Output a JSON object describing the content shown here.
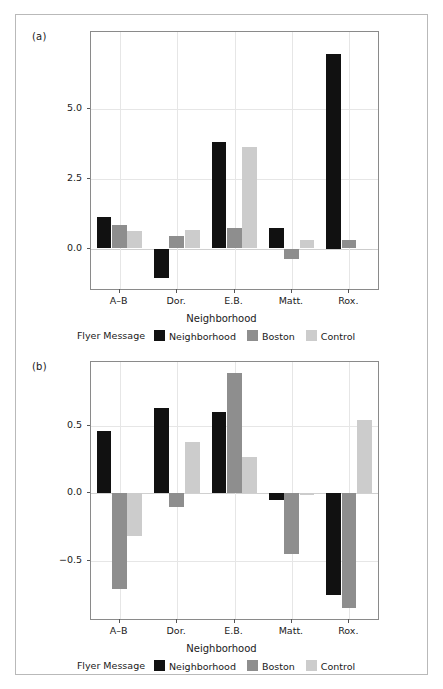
{
  "figure": {
    "panels": [
      {
        "tag": "(a)"
      },
      {
        "tag": "(b)"
      }
    ],
    "legend": {
      "title": "Flyer Message",
      "entries": [
        {
          "label": "Neighborhood",
          "color": "#111111"
        },
        {
          "label": "Boston",
          "color": "#8e8e8e"
        },
        {
          "label": "Control",
          "color": "#cccccc"
        }
      ]
    },
    "xlabel": "Neighborhood"
  },
  "chart_data": [
    {
      "panel": "(a)",
      "type": "bar",
      "title": "",
      "xlabel": "Neighborhood",
      "ylabel": "",
      "categories": [
        "A–B",
        "Dor.",
        "E.B.",
        "Matt.",
        "Rox."
      ],
      "yticks": [
        0.0,
        2.5,
        5.0
      ],
      "ytick_labels": [
        "0.0",
        "2.5",
        "5.0"
      ],
      "ylim": [
        -1.45,
        7.75
      ],
      "grid": true,
      "legend_position": "bottom",
      "series": [
        {
          "name": "Neighborhood",
          "color": "#111111",
          "values": [
            1.12,
            -1.04,
            3.82,
            0.74,
            6.98
          ]
        },
        {
          "name": "Boston",
          "color": "#8e8e8e",
          "values": [
            0.85,
            0.46,
            0.72,
            -0.37,
            0.3
          ]
        },
        {
          "name": "Control",
          "color": "#cccccc",
          "values": [
            0.62,
            0.65,
            3.62,
            0.3,
            -0.02
          ]
        }
      ]
    },
    {
      "panel": "(b)",
      "type": "bar",
      "title": "",
      "xlabel": "Neighborhood",
      "ylabel": "",
      "categories": [
        "A–B",
        "Dor.",
        "E.B.",
        "Matt.",
        "Rox."
      ],
      "yticks": [
        -0.5,
        0.0,
        0.5
      ],
      "ytick_labels": [
        "−0.5",
        "0.0",
        "0.5"
      ],
      "ylim": [
        -0.93,
        0.97
      ],
      "grid": true,
      "legend_position": "bottom",
      "series": [
        {
          "name": "Neighborhood",
          "color": "#111111",
          "values": [
            0.46,
            0.63,
            0.6,
            -0.05,
            -0.75
          ]
        },
        {
          "name": "Boston",
          "color": "#8e8e8e",
          "values": [
            -0.71,
            -0.1,
            0.89,
            -0.45,
            -0.85
          ]
        },
        {
          "name": "Control",
          "color": "#cccccc",
          "values": [
            -0.32,
            0.38,
            0.27,
            -0.01,
            0.54
          ]
        }
      ]
    }
  ]
}
